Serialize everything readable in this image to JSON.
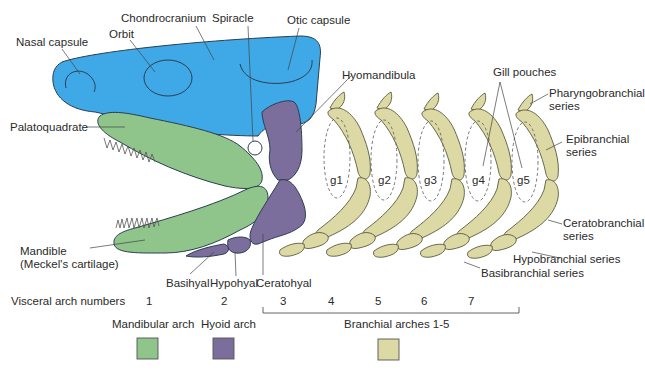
{
  "diagram": {
    "colors": {
      "chondrocranium": "#3fa8e6",
      "mandibular_arch": "#8fc48a",
      "hyoid_arch": "#7c6e9c",
      "branchial_arches": "#dcd9a4",
      "outline": "#2c3e50"
    },
    "labels": {
      "chondrocranium": "Chondrocranium",
      "spiracle": "Spiracle",
      "otic_capsule": "Otic capsule",
      "nasal_capsule": "Nasal capsule",
      "orbit": "Orbit",
      "palatoquadrate": "Palatoquadrate",
      "hyomandibula": "Hyomandibula",
      "mandible_line1": "Mandible",
      "mandible_line2": "(Meckel's cartilage)",
      "basihyal": "Basihyal",
      "hypohyal": "Hypohyal",
      "ceratohyal": "Ceratohyal",
      "gill_pouches": "Gill pouches",
      "pharyngobranchial_line1": "Pharyngobranchial",
      "pharyngobranchial_line2": "series",
      "epibranchial_line1": "Epibranchial",
      "epibranchial_line2": "series",
      "ceratobranchial_line1": "Ceratobranchial",
      "ceratobranchial_line2": "series",
      "hypobranchial": "Hypobranchial series",
      "basibranchial": "Basibranchial series"
    },
    "gill_pouches": [
      "g1",
      "g2",
      "g3",
      "g4",
      "g5"
    ],
    "visceral_arch_numbers": {
      "label": "Visceral arch numbers",
      "numbers": [
        "1",
        "2",
        "3",
        "4",
        "5",
        "6",
        "7"
      ]
    },
    "legend": [
      {
        "label": "Mandibular arch",
        "color": "#8fc48a"
      },
      {
        "label": "Hyoid arch",
        "color": "#7c6e9c"
      },
      {
        "label": "Branchial arches 1-5",
        "color": "#dcd9a4"
      }
    ]
  }
}
